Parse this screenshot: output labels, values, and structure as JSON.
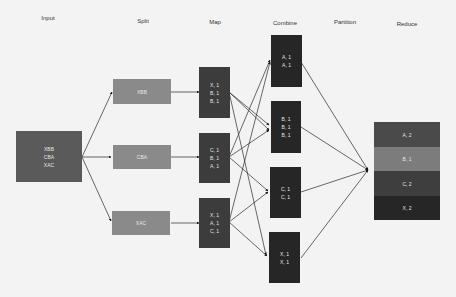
{
  "headers": {
    "input": "Input",
    "split": "Split",
    "map": "Map",
    "combine": "Combine",
    "partition": "Partition",
    "reduce": "Reduce"
  },
  "input": {
    "lines": [
      "XBB",
      "CBA",
      "XAC"
    ]
  },
  "split": [
    {
      "label": "XBB"
    },
    {
      "label": "CBA"
    },
    {
      "label": "XAC"
    }
  ],
  "map": [
    {
      "lines": [
        "X, 1",
        "B, 1",
        "B, 1"
      ]
    },
    {
      "lines": [
        "C, 1",
        "B, 1",
        "A, 1"
      ]
    },
    {
      "lines": [
        "X, 1",
        "A, 1",
        "C, 1"
      ]
    }
  ],
  "combine": [
    {
      "lines": [
        "A, 1",
        "A, 1"
      ]
    },
    {
      "lines": [
        "B, 1",
        "B, 1",
        "B, 1"
      ]
    },
    {
      "lines": [
        "C, 1",
        "C, 1"
      ]
    },
    {
      "lines": [
        "X, 1",
        "X, 1"
      ]
    }
  ],
  "reduce": [
    {
      "label": "A, 2",
      "color": "#4a4a4a"
    },
    {
      "label": "B, 1",
      "color": "#7c7c7c"
    },
    {
      "label": "C, 2",
      "color": "#3e3e3e"
    },
    {
      "label": "X, 2",
      "color": "#262626"
    }
  ]
}
